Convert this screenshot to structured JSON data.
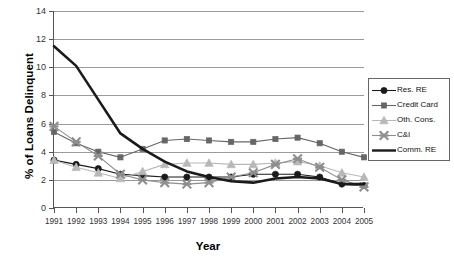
{
  "chart_data": {
    "type": "line",
    "title": "",
    "xlabel": "Year",
    "ylabel": "% of Loans Delinquent",
    "x": [
      1991,
      1992,
      1993,
      1994,
      1995,
      1996,
      1997,
      1998,
      1999,
      2000,
      2001,
      2002,
      2003,
      2004,
      2005
    ],
    "xlim": [
      1991,
      2005
    ],
    "ylim": [
      0,
      14
    ],
    "yticks": [
      0,
      2,
      4,
      6,
      8,
      10,
      12,
      14
    ],
    "grid": true,
    "legend_position": "right",
    "series": [
      {
        "name": "Res. RE",
        "color": "#1a1a1a",
        "marker": "circle",
        "values": [
          3.4,
          3.1,
          2.8,
          2.4,
          2.3,
          2.2,
          2.2,
          2.2,
          2.2,
          2.4,
          2.4,
          2.4,
          2.2,
          1.7,
          1.6
        ]
      },
      {
        "name": "Credit Card",
        "color": "#666666",
        "marker": "square",
        "values": [
          5.4,
          4.6,
          4.0,
          3.6,
          4.2,
          4.8,
          4.9,
          4.8,
          4.7,
          4.7,
          4.9,
          5.0,
          4.6,
          4.0,
          3.6
        ]
      },
      {
        "name": "Oth. Cons.",
        "color": "#b8b8b8",
        "marker": "triangle",
        "values": [
          3.4,
          2.9,
          2.5,
          2.1,
          2.6,
          3.1,
          3.2,
          3.2,
          3.1,
          3.1,
          3.2,
          3.3,
          3.0,
          2.5,
          2.2
        ]
      },
      {
        "name": "C&I",
        "color": "#8e8e8e",
        "marker": "star",
        "values": [
          5.8,
          4.7,
          3.7,
          2.4,
          2.0,
          1.8,
          1.7,
          1.8,
          2.2,
          2.5,
          3.1,
          3.5,
          2.9,
          2.0,
          1.5
        ]
      },
      {
        "name": "Comm. RE",
        "color": "#1a1a1a",
        "marker": "none",
        "values": [
          11.5,
          10.1,
          7.7,
          5.3,
          4.2,
          3.3,
          2.6,
          2.2,
          1.9,
          1.8,
          2.1,
          2.2,
          2.1,
          1.7,
          1.7
        ]
      }
    ]
  },
  "legend": {
    "items": [
      {
        "label": "Res. RE"
      },
      {
        "label": "Credit Card"
      },
      {
        "label": "Oth. Cons."
      },
      {
        "label": "C&I"
      },
      {
        "label": "Comm. RE"
      }
    ]
  }
}
